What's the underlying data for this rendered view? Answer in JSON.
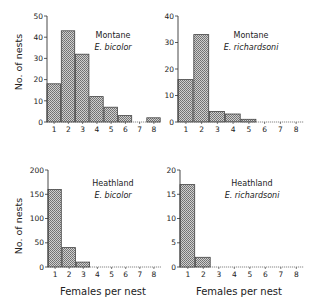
{
  "figure": {
    "x_axis_label": "Females per nest",
    "y_axis_label": "No. of nests",
    "bar_fill": "#a8a8a8",
    "bar_stroke": "#444444"
  },
  "chart_data": [
    {
      "type": "bar",
      "title": "Montane E. bicolor",
      "site": "Montane",
      "species": "E.  bicolor",
      "xlabel": "",
      "ylabel": "No. of nests",
      "categories": [
        "1",
        "2",
        "3",
        "4",
        "5",
        "6",
        "7",
        "8"
      ],
      "values": [
        18,
        43,
        32,
        12,
        7,
        3,
        0,
        2
      ],
      "ylim": [
        0,
        50
      ],
      "yticks": [
        "0",
        "10",
        "20",
        "30",
        "40",
        "50"
      ],
      "grid": false
    },
    {
      "type": "bar",
      "title": "Montane E. richardsoni",
      "site": "Montane",
      "species": "E.  richardsoni",
      "xlabel": "",
      "ylabel": "",
      "categories": [
        "1",
        "2",
        "3",
        "4",
        "5",
        "6",
        "7",
        "8"
      ],
      "values": [
        16,
        33,
        4,
        3,
        1,
        0,
        0,
        0
      ],
      "ylim": [
        0,
        40
      ],
      "yticks": [
        "0",
        "10",
        "20",
        "30",
        "40"
      ],
      "grid": false
    },
    {
      "type": "bar",
      "title": "Heathland E. bicolor",
      "site": "Heathland",
      "species": "E.  bicolor",
      "xlabel": "Females per nest",
      "ylabel": "No. of nests",
      "categories": [
        "1",
        "2",
        "3",
        "4",
        "5",
        "6",
        "7",
        "8"
      ],
      "values": [
        160,
        40,
        10,
        0,
        0,
        0,
        0,
        0
      ],
      "ylim": [
        0,
        200
      ],
      "yticks": [
        "0",
        "50",
        "100",
        "150",
        "200"
      ],
      "grid": false
    },
    {
      "type": "bar",
      "title": "Heathland E. richardsoni",
      "site": "Heathland",
      "species": "E.  richardsoni",
      "xlabel": "Females per nest",
      "ylabel": "",
      "categories": [
        "1",
        "2",
        "3",
        "4",
        "5",
        "6",
        "7",
        "8"
      ],
      "values": [
        17,
        2,
        0,
        0,
        0,
        0,
        0,
        0
      ],
      "ylim": [
        0,
        20
      ],
      "yticks": [
        "0",
        "5",
        "10",
        "15",
        "20"
      ],
      "grid": false
    }
  ]
}
